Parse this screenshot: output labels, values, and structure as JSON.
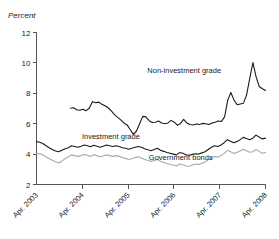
{
  "chart_data": {
    "type": "line",
    "title": "",
    "subtitle": "",
    "ylabel": "Percent",
    "xlabel": "",
    "ylim": [
      2,
      12
    ],
    "yticks": [
      2,
      4,
      6,
      8,
      10,
      12
    ],
    "ytick_labels": [
      "2",
      "4",
      "6",
      "8",
      "10",
      "12"
    ],
    "xticks": [
      "Apr. 2003",
      "Apr. 2004",
      "Apr. 2005",
      "Apr. 2006",
      "Apr. 2007",
      "Apr. 2008"
    ],
    "xlim": [
      "Apr. 2003",
      "Apr. 2008"
    ],
    "grid": false,
    "legend_position": "inline-annotations",
    "annotations": [
      {
        "text": "Non-investment grade",
        "x_frac": 0.645,
        "y_value": 9.35
      },
      {
        "text": "Investment grade",
        "x_frac": 0.325,
        "y_value": 4.98
      },
      {
        "text": "Government bonds",
        "x_frac": 0.63,
        "y_value": 3.62
      }
    ],
    "series": [
      {
        "name": "Non-investment grade",
        "color": "#1a1a1a",
        "x_start_frac": 0.148,
        "values": [
          7.02,
          7.05,
          6.92,
          6.88,
          6.95,
          6.86,
          7.02,
          7.45,
          7.38,
          7.42,
          7.28,
          7.18,
          7.05,
          6.85,
          6.6,
          6.42,
          6.25,
          6.05,
          5.92,
          5.62,
          5.3,
          5.52,
          6.0,
          6.48,
          6.45,
          6.2,
          6.08,
          6.1,
          6.18,
          6.05,
          6.0,
          6.05,
          6.22,
          6.1,
          5.9,
          6.02,
          6.28,
          6.05,
          5.95,
          5.92,
          5.98,
          5.95,
          6.02,
          6.0,
          5.95,
          6.05,
          6.1,
          6.18,
          6.15,
          6.45,
          7.55,
          8.05,
          7.55,
          7.25,
          7.3,
          7.35,
          7.9,
          9.0,
          10.02,
          9.1,
          8.45,
          8.3,
          8.18
        ]
      },
      {
        "name": "Investment grade",
        "color": "#1a1a1a",
        "x_start_frac": 0.0,
        "values": [
          4.82,
          4.78,
          4.7,
          4.55,
          4.42,
          4.3,
          4.2,
          4.15,
          4.25,
          4.35,
          4.42,
          4.55,
          4.5,
          4.45,
          4.52,
          4.6,
          4.55,
          4.48,
          4.58,
          4.52,
          4.45,
          4.52,
          4.6,
          4.55,
          4.5,
          4.55,
          4.5,
          4.42,
          4.38,
          4.32,
          4.38,
          4.45,
          4.5,
          4.45,
          4.35,
          4.28,
          4.22,
          4.3,
          4.38,
          4.25,
          4.18,
          4.1,
          4.05,
          4.0,
          3.95,
          4.1,
          4.05,
          3.95,
          3.92,
          3.98,
          4.02,
          4.0,
          4.08,
          4.15,
          4.3,
          4.45,
          4.55,
          4.5,
          4.6,
          4.75,
          4.95,
          4.85,
          4.75,
          4.82,
          4.95,
          5.1,
          5.02,
          4.95,
          5.05,
          5.25,
          5.12,
          5.0,
          5.05
        ]
      },
      {
        "name": "Government bonds",
        "color": "#a8a8a8",
        "x_start_frac": 0.0,
        "values": [
          4.05,
          4.02,
          3.95,
          3.82,
          3.7,
          3.6,
          3.5,
          3.42,
          3.55,
          3.7,
          3.82,
          3.95,
          3.9,
          3.85,
          3.9,
          3.98,
          3.92,
          3.85,
          3.95,
          3.9,
          3.82,
          3.88,
          3.95,
          3.9,
          3.85,
          3.9,
          3.85,
          3.78,
          3.72,
          3.65,
          3.7,
          3.78,
          3.82,
          3.75,
          3.65,
          3.58,
          3.52,
          3.58,
          3.65,
          3.52,
          3.45,
          3.38,
          3.32,
          3.28,
          3.22,
          3.35,
          3.3,
          3.22,
          3.2,
          3.28,
          3.35,
          3.32,
          3.4,
          3.48,
          3.62,
          3.75,
          3.85,
          3.8,
          3.9,
          4.05,
          4.25,
          4.15,
          4.05,
          4.1,
          4.2,
          4.32,
          4.22,
          4.12,
          4.15,
          4.3,
          4.18,
          4.05,
          4.1
        ]
      }
    ]
  }
}
